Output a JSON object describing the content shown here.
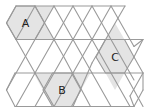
{
  "diagram": {
    "type": "trihexagonal-tiling",
    "colors": {
      "shade": "#e4e4e4",
      "edge": "#9a9a9a",
      "text": "#222222"
    },
    "hexagons": [
      {
        "label": "A",
        "cx": 25.5,
        "cy": 23,
        "points": "16,6 35,6 44.5,23 35,39.5 16,39.5 6.5,23"
      },
      {
        "label": "C",
        "cx": 115,
        "cy": 57,
        "points": "105.5,39.5 124.5,39.5 134,57 124.5,73 105.5,73 96,57"
      },
      {
        "label": "B",
        "cx": 62,
        "cy": 90,
        "points": "52.5,73 71.5,73 81,90 71.5,106.5 52.5,106.5 43,90"
      }
    ],
    "shaded_triangles": [
      "35,6 54,6 44.5,23",
      "35,39.5 54,39.5 44.5,23",
      "105.5,39.5 124.5,39.5 115,23",
      "105.5,73 124.5,73 115,90",
      "33.5,73 52.5,73 43,90",
      "71.5,73 90.5,73 81,90"
    ],
    "edges": [
      [
        16,
        6,
        125,
        6
      ],
      [
        6.5,
        23,
        16,
        6
      ],
      [
        16,
        39.5,
        143,
        39.5
      ],
      [
        15,
        73,
        143,
        73
      ],
      [
        15,
        106.5,
        134,
        106.5
      ],
      [
        6.5,
        23,
        16,
        39.5
      ],
      [
        16,
        39.5,
        35,
        73
      ],
      [
        35,
        73,
        54,
        106.5
      ],
      [
        16,
        39.5,
        25.5,
        23
      ],
      [
        25.5,
        23,
        35,
        6
      ],
      [
        35,
        6,
        63.5,
        56.25
      ],
      [
        63.5,
        56.25,
        90.5,
        106.5
      ],
      [
        54,
        6,
        25.5,
        56.25
      ],
      [
        25.5,
        56.25,
        6.5,
        90
      ],
      [
        6.5,
        90,
        15,
        106.5
      ],
      [
        6.5,
        90,
        15,
        73
      ],
      [
        54,
        6,
        92,
        73
      ],
      [
        92,
        73,
        111,
        106.5
      ],
      [
        73,
        6,
        35,
        73
      ],
      [
        35,
        73,
        16,
        106.5
      ],
      [
        73,
        6,
        111,
        73
      ],
      [
        111,
        73,
        130,
        106.5
      ],
      [
        92,
        6,
        54,
        73
      ],
      [
        54,
        73,
        35,
        106.5
      ],
      [
        92,
        6,
        130,
        73
      ],
      [
        130,
        73,
        134,
        80
      ],
      [
        111,
        6,
        73,
        73
      ],
      [
        73,
        73,
        54,
        106.5
      ],
      [
        111,
        6,
        134,
        46.5
      ],
      [
        125,
        6,
        92,
        63
      ],
      [
        92,
        63,
        73,
        106.5
      ],
      [
        134,
        46.5,
        143,
        39.5
      ],
      [
        143,
        39.5,
        134,
        57
      ],
      [
        134,
        57,
        143,
        73
      ],
      [
        143,
        73,
        130,
        96
      ],
      [
        130,
        96,
        134,
        106.5
      ],
      [
        124.5,
        73,
        143,
        106.5
      ],
      [
        134,
        106.5,
        143,
        90
      ],
      [
        143,
        90,
        143,
        73
      ]
    ]
  }
}
